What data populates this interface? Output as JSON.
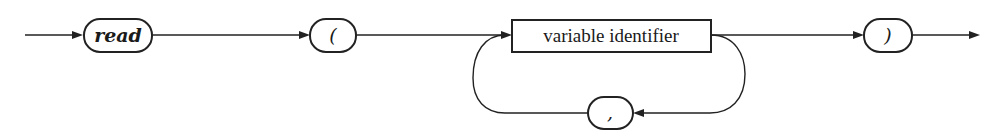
{
  "diagram": {
    "type": "syntax-diagram",
    "rule": "read statement",
    "nodes": [
      {
        "id": "read",
        "kind": "terminal",
        "label": "read"
      },
      {
        "id": "lparen",
        "kind": "terminal",
        "label": "("
      },
      {
        "id": "varid",
        "kind": "nonterminal",
        "label": "variable identifier"
      },
      {
        "id": "comma",
        "kind": "terminal",
        "label": ","
      },
      {
        "id": "rparen",
        "kind": "terminal",
        "label": ")"
      }
    ],
    "edges": [
      {
        "from": "start",
        "to": "read"
      },
      {
        "from": "read",
        "to": "lparen"
      },
      {
        "from": "lparen",
        "to": "varid"
      },
      {
        "from": "varid",
        "to": "rparen"
      },
      {
        "from": "varid",
        "to": "comma",
        "note": "repeat loop"
      },
      {
        "from": "comma",
        "to": "varid"
      },
      {
        "from": "rparen",
        "to": "end"
      }
    ]
  }
}
